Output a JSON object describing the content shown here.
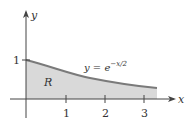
{
  "figure": {
    "function_label": "y = e",
    "exponent": "−x/2",
    "region_label": "R",
    "x_axis_label": "x",
    "y_axis_label": "y",
    "x_ticks": [
      "1",
      "2",
      "3"
    ],
    "y_ticks": [
      "1"
    ],
    "colors": {
      "fill": "#d9d9d9",
      "curve": "#7a7a7a",
      "axis": "#444444"
    }
  }
}
